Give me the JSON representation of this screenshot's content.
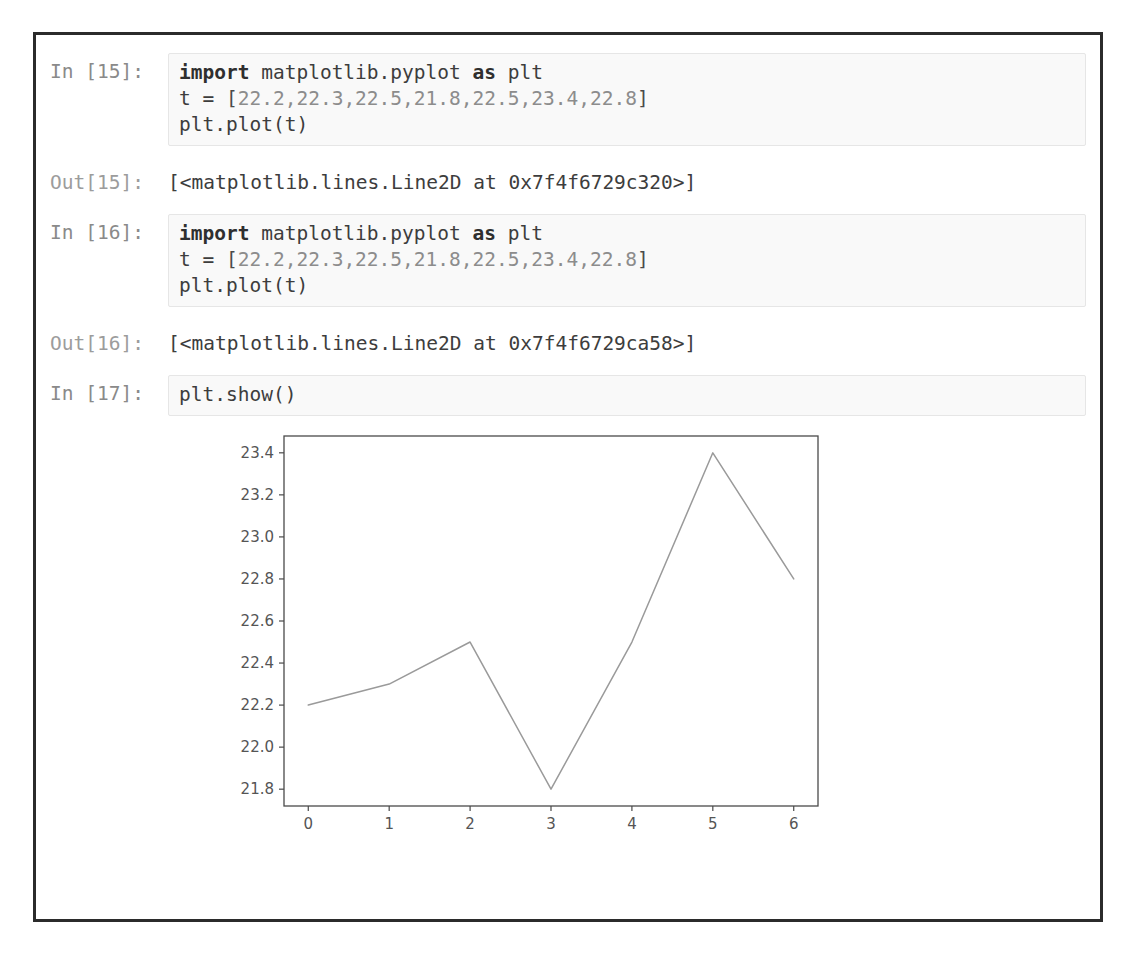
{
  "notebook": {
    "cells": [
      {
        "type": "input",
        "prompt": "In [15]:",
        "lines": [
          {
            "segments": [
              {
                "t": "import",
                "c": "kw"
              },
              {
                "t": " matplotlib.pyplot ",
                "c": "name"
              },
              {
                "t": "as",
                "c": "kw"
              },
              {
                "t": " plt",
                "c": "name"
              }
            ]
          },
          {
            "segments": [
              {
                "t": "t ",
                "c": "name"
              },
              {
                "t": "= ",
                "c": "op"
              },
              {
                "t": "[",
                "c": "punc"
              },
              {
                "t": "22.2,22.3,22.5,21.8,22.5,23.4,22.8",
                "c": "num"
              },
              {
                "t": "]",
                "c": "punc"
              }
            ]
          },
          {
            "segments": [
              {
                "t": "plt.plot(t)",
                "c": "name"
              }
            ]
          }
        ],
        "plain": "import matplotlib.pyplot as plt\nt = [22.2,22.3,22.5,21.8,22.5,23.4,22.8]\nplt.plot(t)"
      },
      {
        "type": "output",
        "prompt": "Out[15]:",
        "text": "[<matplotlib.lines.Line2D at 0x7f4f6729c320>]"
      },
      {
        "type": "input",
        "prompt": "In [16]:",
        "lines": [
          {
            "segments": [
              {
                "t": "import",
                "c": "kw"
              },
              {
                "t": " matplotlib.pyplot ",
                "c": "name"
              },
              {
                "t": "as",
                "c": "kw"
              },
              {
                "t": " plt",
                "c": "name"
              }
            ]
          },
          {
            "segments": [
              {
                "t": "t ",
                "c": "name"
              },
              {
                "t": "= ",
                "c": "op"
              },
              {
                "t": "[",
                "c": "punc"
              },
              {
                "t": "22.2,22.3,22.5,21.8,22.5,23.4,22.8",
                "c": "num"
              },
              {
                "t": "]",
                "c": "punc"
              }
            ]
          },
          {
            "segments": [
              {
                "t": "plt.plot(t)",
                "c": "name"
              }
            ]
          }
        ],
        "plain": "import matplotlib.pyplot as plt\nt = [22.2,22.3,22.5,21.8,22.5,23.4,22.8]\nplt.plot(t)"
      },
      {
        "type": "output",
        "prompt": "Out[16]:",
        "text": "[<matplotlib.lines.Line2D at 0x7f4f6729ca58>]"
      },
      {
        "type": "input",
        "prompt": "In [17]:",
        "lines": [
          {
            "segments": [
              {
                "t": "plt.show()",
                "c": "name"
              }
            ]
          }
        ],
        "plain": "plt.show()"
      }
    ]
  },
  "colors": {
    "frame_border": "#2b2b2b",
    "input_bg": "#f9f9f9",
    "input_border": "#e6e6e6",
    "prompt_text": "#8e8e8e",
    "code_text": "#3d3d3d",
    "plot_line": "#9a9a9a",
    "axes_spine": "#4a4a4a",
    "tick_label": "#555555"
  },
  "chart_data": {
    "type": "line",
    "title": "",
    "xlabel": "",
    "ylabel": "",
    "x": [
      0,
      1,
      2,
      3,
      4,
      5,
      6
    ],
    "values": [
      22.2,
      22.3,
      22.5,
      21.8,
      22.5,
      23.4,
      22.8
    ],
    "series": [
      {
        "name": "t",
        "values": [
          22.2,
          22.3,
          22.5,
          21.8,
          22.5,
          23.4,
          22.8
        ]
      }
    ],
    "xticks": [
      "0",
      "1",
      "2",
      "3",
      "4",
      "5",
      "6"
    ],
    "yticks": [
      "21.8",
      "22.0",
      "22.2",
      "22.4",
      "22.6",
      "22.8",
      "23.0",
      "23.2",
      "23.4"
    ],
    "xlim": [
      -0.3,
      6.3
    ],
    "ylim": [
      21.72,
      23.48
    ],
    "grid": false,
    "legend": null,
    "line_color": "#9a9a9a",
    "line_width": 1.5
  }
}
